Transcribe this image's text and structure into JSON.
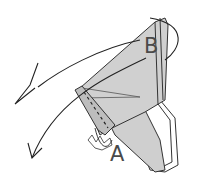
{
  "diagram": {
    "type": "origami-folding-step",
    "labels": {
      "a": "A",
      "b": "B"
    },
    "colors": {
      "paper_fill": "#cfcfcf",
      "paper_light": "#e6e6e6",
      "line": "#333333",
      "background": "#ffffff"
    },
    "annotations": [
      {
        "id": "arrow-upper",
        "kind": "valley-fold-arrow"
      },
      {
        "id": "arrow-lower",
        "kind": "curved-arrow"
      },
      {
        "id": "crease",
        "kind": "dashed-valley-line"
      }
    ]
  }
}
